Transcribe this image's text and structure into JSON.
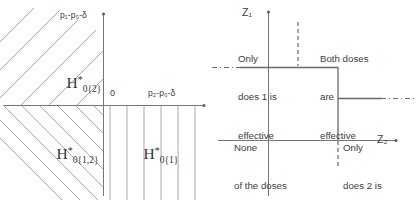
{
  "figure": {
    "type": "two-panel-diagram",
    "panels": [
      {
        "id": "left",
        "name": "hypothesis-partition-plane",
        "axes": {
          "y_label": "p₁-p₀-δ",
          "x_label": "p₂-p₀-δ",
          "origin_label": "0"
        },
        "regions": [
          {
            "name": "H0{2}",
            "base": "H",
            "superscript": "*",
            "subscript": "0{2}",
            "hatch": "diagonal-up-right",
            "quadrant": "II"
          },
          {
            "name": "H0{1,2}",
            "base": "H",
            "superscript": "*",
            "subscript": "0{1,2}",
            "hatch": "diagonal-down-right",
            "quadrant": "III"
          },
          {
            "name": "H0{1}",
            "base": "H",
            "superscript": "*",
            "subscript": "0{1}",
            "hatch": "vertical",
            "quadrant": "IV"
          }
        ]
      },
      {
        "id": "right",
        "name": "decision-boundary-plane",
        "axes": {
          "y_label": "Z₁",
          "x_label": "Z₂"
        },
        "quadrant_labels": [
          {
            "name": "only-dose-1-effective",
            "lines": [
              "Only",
              "does 1 is",
              "effective"
            ],
            "position": "upper-left"
          },
          {
            "name": "both-doses-effective",
            "lines": [
              "Both doses",
              "are",
              "effective"
            ],
            "position": "upper-right"
          },
          {
            "name": "none-effective",
            "lines": [
              "None",
              "of the doses",
              "is effective"
            ],
            "position": "lower-left"
          },
          {
            "name": "only-dose-2-effective",
            "lines": [
              "Only",
              "does 2 is",
              "effective"
            ],
            "position": "lower-right"
          }
        ],
        "boundary": {
          "name": "critical-region-step",
          "style": "solid step with dash-dot extensions",
          "dashed_guides": [
            "vertical-upper",
            "vertical-lower"
          ]
        }
      }
    ],
    "colors": {
      "line": "#6f6f6f",
      "hatch": "#9a9a9a",
      "text": "#3d3d3d",
      "background": "#ffffff"
    }
  }
}
